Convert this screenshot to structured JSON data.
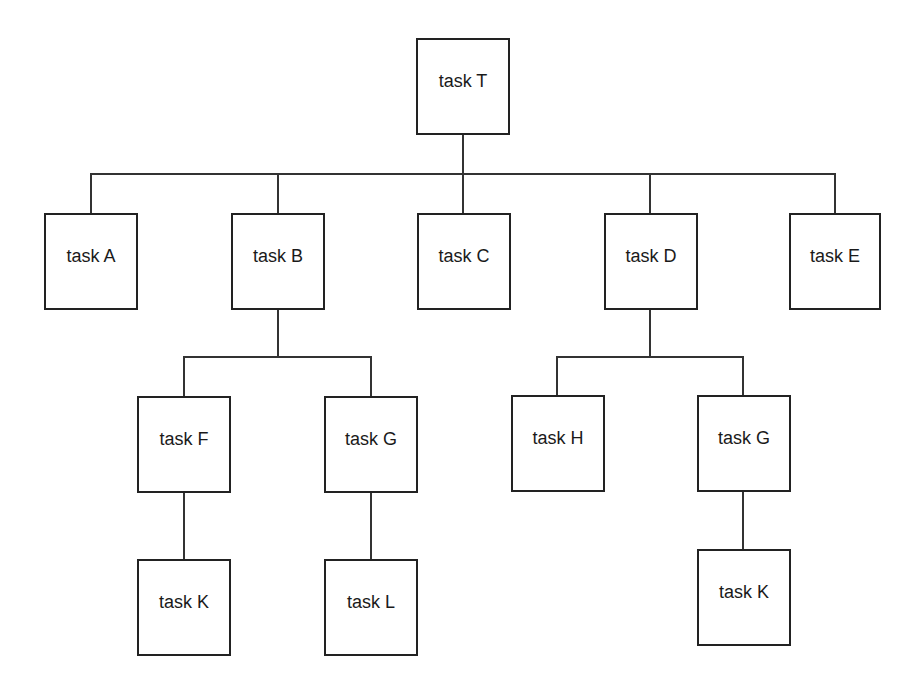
{
  "diagram": {
    "type": "hierarchy",
    "colors": {
      "stroke": "#222222",
      "background": "#ffffff",
      "text": "#1a1a1a"
    },
    "nodes": {
      "T": {
        "label": "task T",
        "x": 416,
        "y": 38,
        "w": 94,
        "h": 97
      },
      "A": {
        "label": "task A",
        "x": 44,
        "y": 213,
        "w": 94,
        "h": 97
      },
      "B": {
        "label": "task B",
        "x": 231,
        "y": 213,
        "w": 94,
        "h": 97
      },
      "C": {
        "label": "task C",
        "x": 417,
        "y": 213,
        "w": 94,
        "h": 97
      },
      "D": {
        "label": "task D",
        "x": 604,
        "y": 213,
        "w": 94,
        "h": 97
      },
      "E": {
        "label": "task E",
        "x": 789,
        "y": 213,
        "w": 92,
        "h": 97
      },
      "F": {
        "label": "task F",
        "x": 137,
        "y": 396,
        "w": 94,
        "h": 97
      },
      "G": {
        "label": "task G",
        "x": 324,
        "y": 396,
        "w": 94,
        "h": 97
      },
      "H": {
        "label": "task H",
        "x": 511,
        "y": 395,
        "w": 94,
        "h": 97
      },
      "G2": {
        "label": "task G",
        "x": 697,
        "y": 395,
        "w": 94,
        "h": 97
      },
      "K": {
        "label": "task K",
        "x": 137,
        "y": 559,
        "w": 94,
        "h": 97
      },
      "L": {
        "label": "task L",
        "x": 324,
        "y": 559,
        "w": 94,
        "h": 97
      },
      "K2": {
        "label": "task K",
        "x": 697,
        "y": 549,
        "w": 94,
        "h": 97
      }
    },
    "edges": [
      {
        "from": "T",
        "to": [
          "A",
          "B",
          "C",
          "D",
          "E"
        ]
      },
      {
        "from": "B",
        "to": [
          "F",
          "G"
        ]
      },
      {
        "from": "D",
        "to": [
          "H",
          "G2"
        ]
      },
      {
        "from": "F",
        "to": [
          "K"
        ]
      },
      {
        "from": "G",
        "to": [
          "L"
        ]
      },
      {
        "from": "G2",
        "to": [
          "K2"
        ]
      }
    ]
  }
}
